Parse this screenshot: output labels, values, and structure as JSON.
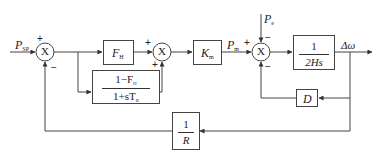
{
  "diagram": {
    "type": "block_diagram",
    "inputs": {
      "setpoint": {
        "symbol": "P",
        "subscript": "SP"
      },
      "electrical_power": {
        "symbol": "P",
        "subscript": "e"
      }
    },
    "summing_junctions": [
      {
        "id": "sum1",
        "symbol": "X",
        "signs": {
          "top": "+",
          "bottom": "−"
        }
      },
      {
        "id": "sum2",
        "symbol": "X",
        "signs": {
          "left": "+",
          "bottom": "+"
        }
      },
      {
        "id": "sum3",
        "symbol": "X",
        "signs": {
          "left": "+",
          "top": "−",
          "bottom": "−"
        }
      }
    ],
    "blocks": {
      "fh": {
        "symbol": "F",
        "subscript": "H"
      },
      "leadlag": {
        "num": "1−F",
        "num_sub": "H",
        "den": "1+sT",
        "den_sub": "R"
      },
      "km": {
        "symbol": "K",
        "subscript": "m"
      },
      "inertia": {
        "num": "1",
        "den": "2Hs"
      },
      "damping": {
        "symbol": "D"
      },
      "droop": {
        "num": "1",
        "den": "R"
      }
    },
    "signals": {
      "mechanical_power": {
        "symbol": "P",
        "subscript": "m"
      },
      "output": {
        "symbol": "Δω"
      }
    },
    "colors": {
      "line": "#444444",
      "text": "#222222",
      "background": "#ffffff"
    }
  }
}
